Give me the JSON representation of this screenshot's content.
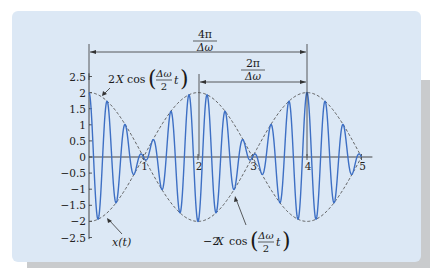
{
  "colors": {
    "panel": "#dce8f5",
    "shadow": "#c9cbcd",
    "signal": "#3d6fc4",
    "envelope": "#555555",
    "axis": "#333333"
  },
  "chart_data": {
    "type": "line",
    "title": "",
    "xlabel": "",
    "ylabel": "",
    "xlim": [
      0,
      5
    ],
    "ylim": [
      -2.5,
      2.5
    ],
    "x_ticks": [
      "1",
      "2",
      "3",
      "4",
      "5"
    ],
    "y_ticks": [
      "2.5",
      "2",
      "1.5",
      "1",
      "0.5",
      "0",
      "−0.5",
      "−1",
      "−1.5",
      "−2",
      "−2.5"
    ],
    "grid": false,
    "series": [
      {
        "name": "x(t)",
        "style": "solid",
        "formula": "2*cos(pi*t/2)*cos(6*pi*t)",
        "color": "#3d6fc4",
        "peaks": [
          {
            "t": 0,
            "v": 2.0
          },
          {
            "t": 0.167,
            "v": -1.93
          },
          {
            "t": 0.333,
            "v": 1.73
          },
          {
            "t": 0.5,
            "v": -1.41
          },
          {
            "t": 0.667,
            "v": 1.0
          },
          {
            "t": 0.833,
            "v": -0.52
          },
          {
            "t": 1.0,
            "v": 0.0
          },
          {
            "t": 2.0,
            "v": 2.0
          },
          {
            "t": 3.0,
            "v": 0.0
          },
          {
            "t": 4.0,
            "v": 2.0
          },
          {
            "t": 5.0,
            "v": 0.0
          }
        ]
      },
      {
        "name": "2X cos(Δω/2 t)",
        "style": "dashed",
        "formula": "2*cos(pi*t/2)",
        "color": "#555555"
      },
      {
        "name": "−2X cos(Δω/2 t)",
        "style": "dashed",
        "formula": "-2*cos(pi*t/2)",
        "color": "#555555"
      }
    ],
    "annotations": [
      {
        "text": "4π/Δω",
        "type": "dimension-arrow",
        "from_t": 0,
        "to_t": 4
      },
      {
        "text": "2π/Δω",
        "type": "dimension-arrow",
        "from_t": 2,
        "to_t": 4
      },
      {
        "text": "2X cos(Δω/2 t)",
        "type": "leader",
        "points_to": "upper envelope near t=0.2"
      },
      {
        "text": "−2X cos(Δω/2 t)",
        "type": "leader",
        "points_to": "lower envelope near t=2.6"
      },
      {
        "text": "x(t)",
        "type": "leader",
        "points_to": "signal near t=0.2, v=-1.9"
      }
    ]
  },
  "labels": {
    "big_span_num": "4π",
    "big_span_den": "Δω",
    "small_span_num": "2π",
    "small_span_den": "Δω",
    "upper_env_prefix": "2",
    "upper_env_X": "X",
    "cos": "cos",
    "frac_num": "Δω",
    "frac_den": "2",
    "t": "t",
    "lower_env_prefix": "−2",
    "signal_label": "x(t)"
  }
}
